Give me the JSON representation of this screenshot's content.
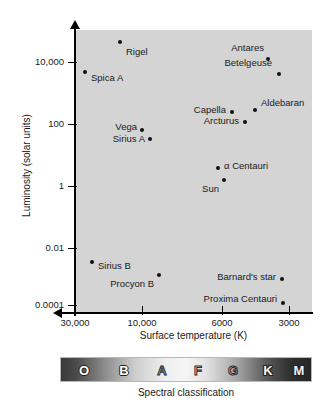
{
  "figure": {
    "background_color": "#ffffff",
    "plot_background_color": "#d4d4d4",
    "point_color": "#111111"
  },
  "axes": {
    "y_title": "Luminosity (solar units)",
    "x_title": "Surface temperature (K)",
    "y_ticks": [
      "10,000",
      "100",
      "1",
      "0.01",
      "0.0001"
    ],
    "x_ticks": [
      "30,000",
      "10,000",
      "6000",
      "3000"
    ]
  },
  "spectral": {
    "caption": "Spectral classification",
    "classes": [
      "O",
      "B",
      "A",
      "F",
      "G",
      "K",
      "M"
    ]
  },
  "chart_data": {
    "type": "scatter",
    "xlabel": "Surface temperature (K)",
    "ylabel": "Luminosity (solar units)",
    "x_scale": "log-reversed",
    "y_scale": "log",
    "x_tick_values": [
      30000,
      10000,
      6000,
      3000
    ],
    "x_tick_labels": [
      "30,000",
      "10,000",
      "6000",
      "3000"
    ],
    "y_tick_values": [
      10000,
      100,
      1,
      0.01,
      0.0001
    ],
    "y_tick_labels": [
      "10,000",
      "100",
      "1",
      "0.01",
      "0.0001"
    ],
    "grid": false,
    "legend": "none",
    "spectral_classes": [
      "O",
      "B",
      "A",
      "F",
      "G",
      "K",
      "M"
    ],
    "points": [
      {
        "name": "Rigel",
        "temperature_K": 12000,
        "luminosity_solar": 60000,
        "label_position": "below-right"
      },
      {
        "name": "Spica A",
        "temperature_K": 22000,
        "luminosity_solar": 2000,
        "label_position": "right"
      },
      {
        "name": "Antares",
        "temperature_K": 3500,
        "luminosity_solar": 20000,
        "label_position": "above-left"
      },
      {
        "name": "Betelgeuse",
        "temperature_K": 3100,
        "luminosity_solar": 9000,
        "label_position": "above-left"
      },
      {
        "name": "Capella",
        "temperature_K": 5200,
        "luminosity_solar": 150,
        "label_position": "left"
      },
      {
        "name": "Aldebaran",
        "temperature_K": 4000,
        "luminosity_solar": 180,
        "label_position": "right"
      },
      {
        "name": "Arcturus",
        "temperature_K": 4300,
        "luminosity_solar": 110,
        "label_position": "left"
      },
      {
        "name": "Vega",
        "temperature_K": 9600,
        "luminosity_solar": 80,
        "label_position": "left"
      },
      {
        "name": "Sirius A",
        "temperature_K": 9000,
        "luminosity_solar": 45,
        "label_position": "left"
      },
      {
        "name": "α Centauri",
        "temperature_K": 5800,
        "luminosity_solar": 2.5,
        "label_position": "right"
      },
      {
        "name": "Sun",
        "temperature_K": 5600,
        "luminosity_solar": 1.3,
        "label_position": "below-left"
      },
      {
        "name": "Sirius B",
        "temperature_K": 21000,
        "luminosity_solar": 0.003,
        "label_position": "right"
      },
      {
        "name": "Procyon B",
        "temperature_K": 8500,
        "luminosity_solar": 0.0008,
        "label_position": "below-left"
      },
      {
        "name": "Barnard's star",
        "temperature_K": 3200,
        "luminosity_solar": 0.0005,
        "label_position": "left"
      },
      {
        "name": "Proxima Centauri",
        "temperature_K": 3150,
        "luminosity_solar": 5e-05,
        "label_position": "left"
      }
    ]
  },
  "geometry": {
    "y_tick_pixels": [
      62,
      124,
      186,
      248,
      305
    ],
    "x_tick_pixels": [
      75,
      142,
      222,
      289
    ],
    "points_pixels": [
      {
        "name": "Rigel",
        "x": 120,
        "y": 42,
        "lx": 126,
        "ly": 52,
        "align": "lbl-right"
      },
      {
        "name": "Spica A",
        "x": 85,
        "y": 72,
        "lx": 91,
        "ly": 78,
        "align": "lbl-right"
      },
      {
        "name": "Antares",
        "x": 268,
        "y": 59,
        "lx": 264,
        "ly": 48,
        "align": "lbl-left"
      },
      {
        "name": "Betelgeuse",
        "x": 279,
        "y": 74,
        "lx": 272,
        "ly": 63,
        "align": "lbl-left"
      },
      {
        "name": "Capella",
        "x": 232,
        "y": 112,
        "lx": 226,
        "ly": 110,
        "align": "lbl-left"
      },
      {
        "name": "Aldebaran",
        "x": 255,
        "y": 110,
        "lx": 261,
        "ly": 103,
        "align": "lbl-right"
      },
      {
        "name": "Arcturus",
        "x": 245,
        "y": 122,
        "lx": 239,
        "ly": 121,
        "align": "lbl-left"
      },
      {
        "name": "Vega",
        "x": 142,
        "y": 130,
        "lx": 137,
        "ly": 127,
        "align": "lbl-left"
      },
      {
        "name": "Sirius A",
        "x": 150,
        "y": 139,
        "lx": 145,
        "ly": 139,
        "align": "lbl-left"
      },
      {
        "name": "α Centauri",
        "x": 218,
        "y": 168,
        "lx": 224,
        "ly": 166,
        "align": "lbl-right"
      },
      {
        "name": "Sun",
        "x": 224,
        "y": 180,
        "lx": 219,
        "ly": 189,
        "align": "lbl-left"
      },
      {
        "name": "Sirius B",
        "x": 92,
        "y": 262,
        "lx": 98,
        "ly": 266,
        "align": "lbl-right"
      },
      {
        "name": "Procyon B",
        "x": 159,
        "y": 275,
        "lx": 154,
        "ly": 284,
        "align": "lbl-left"
      },
      {
        "name": "Barnard's star",
        "x": 282,
        "y": 279,
        "lx": 276,
        "ly": 277,
        "align": "lbl-left"
      },
      {
        "name": "Proxima Centauri",
        "x": 283,
        "y": 303,
        "lx": 277,
        "ly": 299,
        "align": "lbl-left"
      }
    ],
    "spectral_letter_pixels": [
      {
        "letter": "O",
        "x": 23,
        "style": "spec-light"
      },
      {
        "letter": "B",
        "x": 63,
        "style": "spec-light"
      },
      {
        "letter": "A",
        "x": 101,
        "style": "spec-outline"
      },
      {
        "letter": "F",
        "x": 137,
        "style": "spec-outline"
      },
      {
        "letter": "G",
        "x": 172,
        "style": "spec-outline"
      },
      {
        "letter": "K",
        "x": 207,
        "style": "spec-dark"
      },
      {
        "letter": "M",
        "x": 238,
        "style": "spec-dark"
      }
    ]
  }
}
